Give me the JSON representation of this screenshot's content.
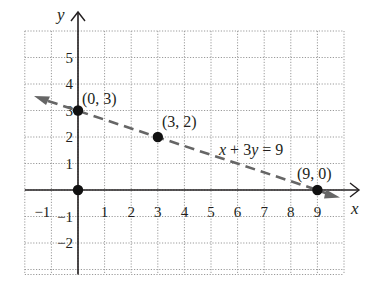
{
  "chart_data": {
    "type": "line",
    "title": "",
    "xlabel": "x",
    "ylabel": "y",
    "xlim": [
      -2,
      10
    ],
    "ylim": [
      -3,
      6
    ],
    "grid": true,
    "grid_style": "dotted",
    "x_ticks": [
      -1,
      1,
      2,
      3,
      4,
      5,
      6,
      7,
      8,
      9
    ],
    "x_tick_labels": [
      "−1",
      "1",
      "2",
      "3",
      "4",
      "5",
      "6",
      "7",
      "8",
      "9"
    ],
    "y_ticks": [
      5,
      4,
      3,
      2,
      1,
      -1,
      -2
    ],
    "y_tick_labels": [
      "5",
      "4",
      "3",
      "2",
      "1",
      "−1",
      "−2"
    ],
    "series": [
      {
        "name": "x + 3y = 9",
        "style": "dashed",
        "color": "#666666",
        "equation": "x + 3y = 9",
        "x": [
          -2,
          9.5
        ],
        "y": [
          3.667,
          -0.167
        ],
        "arrow_left": true,
        "arrow_right": true
      }
    ],
    "points": [
      {
        "x": 0,
        "y": 3,
        "label": "(0, 3)"
      },
      {
        "x": 3,
        "y": 2,
        "label": "(3, 2)"
      },
      {
        "x": 9,
        "y": 0,
        "label": "(9, 0)"
      },
      {
        "x": 0,
        "y": 0,
        "label": ""
      }
    ],
    "annotations": [
      {
        "text": "x + 3y = 9",
        "x": 5.5,
        "y": 1.5
      }
    ]
  },
  "axes": {
    "x_label": "x",
    "y_label": "y"
  },
  "colors": {
    "axis": "#231f20",
    "grid": "#9a9a9a",
    "line": "#666666",
    "point": "#111111"
  }
}
